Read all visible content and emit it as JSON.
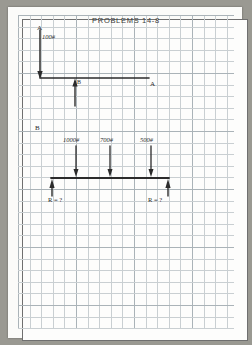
{
  "document": {
    "title": "PROBLEMS 14-8",
    "medium": "graph-paper-worksheet"
  },
  "diagram_top": {
    "label_point_a": "A",
    "label_point_b": "B",
    "label_point_a_right": "A",
    "load_label": "100#"
  },
  "diagram_bottom": {
    "label_point_b": "B",
    "loads": [
      {
        "label": "1000#"
      },
      {
        "label": "700#"
      },
      {
        "label": "500#"
      }
    ],
    "reaction_left": "R = ?",
    "reaction_right": "R = ?"
  },
  "colors": {
    "ink": "#2b2b2b",
    "grid_minor": "#c9cfd2",
    "grid_major": "#aab3b8",
    "paper": "#fbfbf9",
    "scan_background": "#9a9992"
  },
  "chart_data": {
    "type": "diagram",
    "title": "PROBLEMS 14-8",
    "figures": [
      {
        "name": "bent-member-free-body",
        "point_labels": [
          "A",
          "B",
          "A"
        ],
        "applied_load": "100#",
        "load_direction": "downward",
        "members": [
          "vertical at A",
          "horizontal A-to-A through B"
        ],
        "support_reaction": "upward at B"
      },
      {
        "name": "simple-beam-free-body",
        "point_label": "B",
        "load_labels": [
          "1000#",
          "700#",
          "500#"
        ],
        "load_direction": "downward",
        "reaction_labels": [
          "R = ?",
          "R = ?"
        ],
        "reaction_direction": "upward",
        "supports": 2
      }
    ]
  }
}
